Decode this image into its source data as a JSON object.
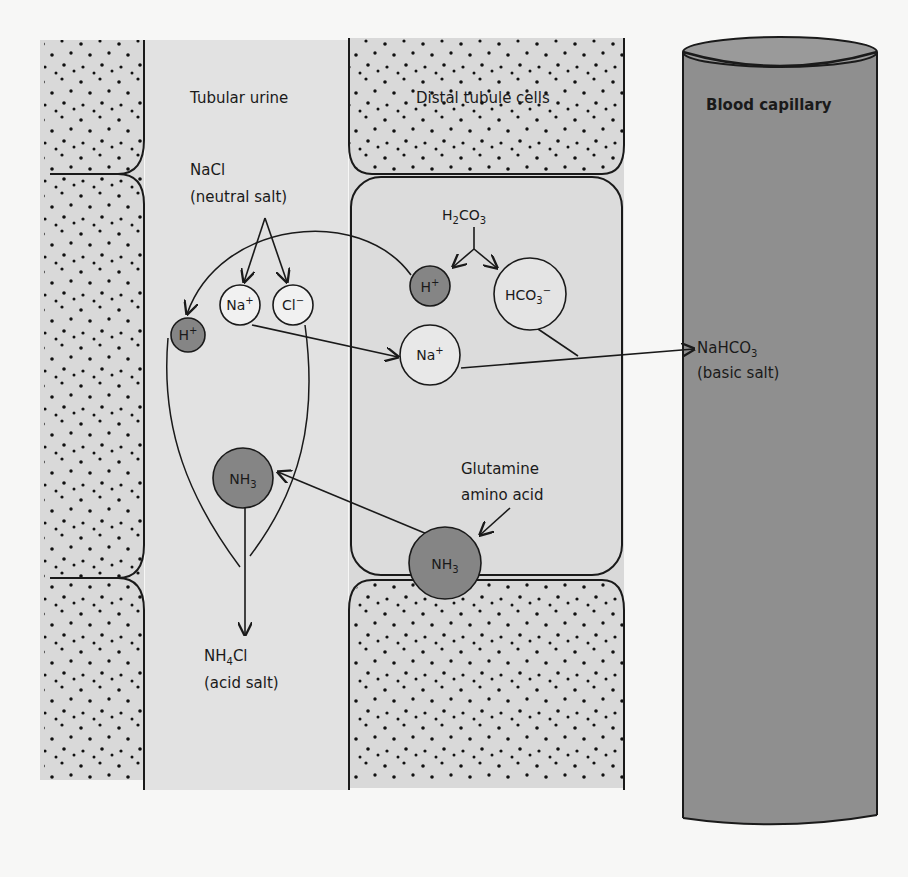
{
  "diagram": {
    "regions": {
      "tubular_urine": "Tubular urine",
      "distal_tubule_cells": "Distal tubule cells",
      "blood_capillary": "Blood capillary"
    },
    "labels": {
      "nacl": "NaCl",
      "nacl_desc": "(neutral salt)",
      "h2co3_main": "H",
      "h2co3_sub": "2",
      "h2co3_rest": "CO",
      "h2co3_sub2": "3",
      "nahco3_main": "NaHCO",
      "nahco3_sub": "3",
      "nahco3_desc": "(basic salt)",
      "glutamine": "Glutamine",
      "glutamine_desc": "amino acid",
      "nh4cl_a": "NH",
      "nh4cl_sub": "4",
      "nh4cl_b": "Cl",
      "nh4cl_desc": "(acid salt)"
    },
    "ions": {
      "na_urine": {
        "main": "Na",
        "sup": "+"
      },
      "cl_urine": {
        "main": "Cl",
        "sup": "−"
      },
      "h_urine": {
        "main": "H",
        "sup": "+"
      },
      "h_cell": {
        "main": "H",
        "sup": "+"
      },
      "hco3_cell": {
        "main": "HCO",
        "sub": "3",
        "sup": "−"
      },
      "na_cell": {
        "main": "Na",
        "sup": "+"
      },
      "nh3_urine": {
        "main": "NH",
        "sub": "3"
      },
      "nh3_cell": {
        "main": "NH",
        "sub": "3"
      }
    },
    "colors": {
      "background": "#f7f7f6",
      "cell_fill": "#d9d9d9",
      "urine_fill": "#e2e2e2",
      "blood_fill": "#8f8f8f",
      "dark_ion": "#858585",
      "outline": "#1a1a1a"
    }
  }
}
